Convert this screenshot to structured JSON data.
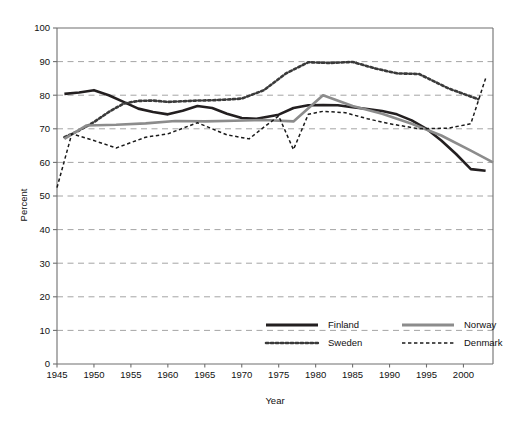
{
  "chart_data": {
    "type": "line",
    "title": "",
    "xlabel": "Year",
    "ylabel": "Percent",
    "xlim": [
      1945,
      2004
    ],
    "ylim": [
      0,
      100
    ],
    "grid": true,
    "grid_axis": "y",
    "legend_position": "inside-bottom-center",
    "xticks": [
      1945,
      1950,
      1955,
      1960,
      1965,
      1970,
      1975,
      1980,
      1985,
      1990,
      1995,
      2000
    ],
    "xtick_labels": [
      "1945",
      "1950",
      "1955",
      "1960",
      "1965",
      "1970",
      "1975",
      "1980",
      "1985",
      "1990",
      "1995",
      "2000"
    ],
    "yticks": [
      0,
      10,
      20,
      30,
      40,
      50,
      60,
      70,
      80,
      90,
      100
    ],
    "ytick_labels": [
      "0",
      "10",
      "20",
      "30",
      "40",
      "50",
      "60",
      "70",
      "80",
      "90",
      "100"
    ],
    "series": [
      {
        "name": "Finland",
        "style": "solid",
        "color": "#231f20",
        "width": 2.6,
        "x": [
          1946,
          1948,
          1950,
          1952,
          1954,
          1956,
          1958,
          1960,
          1962,
          1964,
          1966,
          1968,
          1970,
          1972,
          1975,
          1977,
          1979,
          1981,
          1983,
          1985,
          1987,
          1989,
          1991,
          1993,
          1995,
          1997,
          1999,
          2001,
          2003
        ],
        "y": [
          80.4,
          80.8,
          81.5,
          80.0,
          78.0,
          76.0,
          75.0,
          74.3,
          75.4,
          76.8,
          76.2,
          74.5,
          73.2,
          73.0,
          74.2,
          76.2,
          77.0,
          77.1,
          77.0,
          76.4,
          75.9,
          75.3,
          74.3,
          72.5,
          70.0,
          66.5,
          62.5,
          58.0,
          57.5
        ]
      },
      {
        "name": "Sweden",
        "style": "dotted",
        "color": "#3a3a3a",
        "width": 2.6,
        "x": [
          1946,
          1948,
          1950,
          1952,
          1954,
          1956,
          1958,
          1960,
          1962,
          1964,
          1966,
          1968,
          1970,
          1973,
          1976,
          1979,
          1982,
          1985,
          1988,
          1991,
          1994,
          1998,
          2002
        ],
        "y": [
          67.5,
          69.5,
          72.0,
          75.0,
          77.5,
          78.3,
          78.4,
          78.0,
          78.2,
          78.4,
          78.5,
          78.7,
          79.0,
          81.5,
          86.5,
          89.8,
          89.6,
          89.9,
          88.0,
          86.5,
          86.3,
          82.0,
          78.8
        ]
      },
      {
        "name": "Norway",
        "style": "solid",
        "color": "#8c8c8c",
        "width": 2.6,
        "x": [
          1946,
          1949,
          1953,
          1957,
          1961,
          1965,
          1969,
          1973,
          1977,
          1981,
          1985,
          1989,
          1993,
          1997,
          2001,
          2004
        ],
        "y": [
          67.0,
          71.0,
          71.2,
          71.6,
          72.3,
          72.2,
          72.4,
          72.6,
          72.2,
          80.0,
          76.8,
          74.5,
          71.5,
          68.0,
          63.5,
          60.0
        ]
      },
      {
        "name": "Denmark",
        "style": "dashed",
        "color": "#1a1a1a",
        "width": 1.5,
        "x": [
          1945,
          1947,
          1950,
          1953,
          1957,
          1960,
          1964,
          1966,
          1968,
          1971,
          1973,
          1975,
          1977,
          1979,
          1981,
          1984,
          1987,
          1990,
          1994,
          1998,
          2001,
          2003
        ],
        "y": [
          52.5,
          68.5,
          66.5,
          64.3,
          67.5,
          68.5,
          71.8,
          70.0,
          68.2,
          67.0,
          70.5,
          73.8,
          63.8,
          74.3,
          75.2,
          74.8,
          73.0,
          71.5,
          70.0,
          70.2,
          71.5,
          85.0
        ]
      }
    ]
  },
  "legend": {
    "entries": [
      {
        "label": "Finland",
        "style": "solid",
        "color": "#231f20"
      },
      {
        "label": "Norway",
        "style": "solid",
        "color": "#8c8c8c"
      },
      {
        "label": "Sweden",
        "style": "dotted",
        "color": "#3a3a3a"
      },
      {
        "label": "Denmark",
        "style": "dashed",
        "color": "#1a1a1a"
      }
    ]
  },
  "colors": {
    "finland": "#231f20",
    "sweden": "#3a3a3a",
    "norway": "#8c8c8c",
    "denmark": "#1a1a1a",
    "gridline": "#9a9a9a",
    "axis": "#6f6f6f",
    "background": "#ffffff"
  }
}
